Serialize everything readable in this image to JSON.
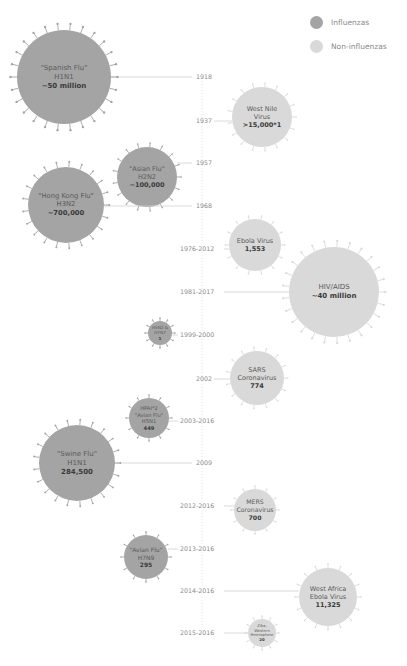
{
  "legend": [
    {
      "label": "Influenzas",
      "color": "#a4a4a4"
    },
    {
      "label": "Non-influenzas",
      "color": "#d9d9d9"
    }
  ],
  "colors": {
    "influenza": "#a4a4a4",
    "non_influenza": "#d9d9d9",
    "axis": "#e2e2e2",
    "connector": "#d0d0d0",
    "text": "#8a8a8a"
  },
  "axis": {
    "x": 202,
    "top": 78,
    "bottom": 636
  },
  "events": [
    {
      "year": "1918",
      "type": "influenza",
      "lines": [
        "\"Spanish Flu\"",
        "H1N1"
      ],
      "value": "~50 million",
      "cx": 64,
      "cy": 77,
      "r": 47,
      "year_y": 77,
      "fs": 7
    },
    {
      "year": "1937",
      "type": "non_influenza",
      "lines": [
        "West Nile",
        "Virus"
      ],
      "value": ">15,000*1",
      "cx": 262,
      "cy": 117,
      "r": 30,
      "year_y": 121,
      "fs": 6.5
    },
    {
      "year": "1957",
      "type": "influenza",
      "lines": [
        "\"Asian Flu\"",
        "H2N2"
      ],
      "value": "~100,000",
      "cx": 147,
      "cy": 177,
      "r": 30,
      "year_y": 163,
      "fs": 6.5
    },
    {
      "year": "1968",
      "type": "influenza",
      "lines": [
        "\"Hong Kong Flu\"",
        "H3N2"
      ],
      "value": "~700,000",
      "cx": 66,
      "cy": 205,
      "r": 38,
      "year_y": 206,
      "fs": 6.8
    },
    {
      "year": "1976-2012",
      "type": "non_influenza",
      "lines": [
        "Ebola Virus"
      ],
      "value": "1,553",
      "cx": 255,
      "cy": 245,
      "r": 26,
      "year_y": 249,
      "fs": 6.5
    },
    {
      "year": "1981-2017",
      "type": "non_influenza",
      "lines": [
        "HIV/AIDS"
      ],
      "value": "~40 million",
      "cx": 334,
      "cy": 292,
      "r": 45,
      "year_y": 292,
      "fs": 7
    },
    {
      "year": "1999-2000",
      "type": "influenza",
      "lines": [
        "H5N2 &",
        "H7N7"
      ],
      "value": "1",
      "cx": 160,
      "cy": 333,
      "r": 12,
      "year_y": 335,
      "fs": 4.2
    },
    {
      "year": "2002",
      "type": "non_influenza",
      "lines": [
        "SARS",
        "Coronavirus"
      ],
      "value": "774",
      "cx": 257,
      "cy": 378,
      "r": 27,
      "year_y": 379,
      "fs": 6.5
    },
    {
      "year": "2003-2016",
      "type": "influenza",
      "lines": [
        "HPAI*2",
        "\"Avian Flu\"",
        "H5N1"
      ],
      "value": "449",
      "cx": 149,
      "cy": 418,
      "r": 20,
      "year_y": 421,
      "fs": 5.2
    },
    {
      "year": "2009",
      "type": "influenza",
      "lines": [
        "\"Swine Flu\"",
        "H1N1"
      ],
      "value": "284,500",
      "cx": 77,
      "cy": 463,
      "r": 38,
      "year_y": 463,
      "fs": 7
    },
    {
      "year": "2012-2016",
      "type": "non_influenza",
      "lines": [
        "MERS",
        "Coronavirus"
      ],
      "value": "700",
      "cx": 255,
      "cy": 510,
      "r": 21,
      "year_y": 506,
      "fs": 6.2
    },
    {
      "year": "2013-2016",
      "type": "influenza",
      "lines": [
        "\"Avian Flu\"",
        "H7N9"
      ],
      "value": "295",
      "cx": 146,
      "cy": 557,
      "r": 22,
      "year_y": 549,
      "fs": 6
    },
    {
      "year": "2014-2016",
      "type": "non_influenza",
      "lines": [
        "West Africa",
        "Ebola Virus"
      ],
      "value": "11,325",
      "cx": 328,
      "cy": 597,
      "r": 29,
      "year_y": 591,
      "fs": 6.5
    },
    {
      "year": "2015-2016",
      "type": "non_influenza",
      "lines": [
        "Zika,",
        "Western",
        "Hemisphere"
      ],
      "value": "20",
      "cx": 262,
      "cy": 633,
      "r": 14,
      "year_y": 633,
      "fs": 3.8
    }
  ],
  "chart_data": {
    "type": "scatter",
    "title": "",
    "xlabel": "",
    "ylabel": "Year of outbreak",
    "legend": [
      "Influenzas",
      "Non-influenzas"
    ],
    "legend_position": "top-right",
    "grid": false,
    "encoding": "bubble size = estimated deaths; vertical position = year; color = influenza vs non-influenza",
    "series": [
      {
        "name": "Influenzas",
        "points": [
          {
            "year": "1918",
            "label": "\"Spanish Flu\" H1N1",
            "deaths": "~50 million"
          },
          {
            "year": "1957",
            "label": "\"Asian Flu\" H2N2",
            "deaths": "~100,000"
          },
          {
            "year": "1968",
            "label": "\"Hong Kong Flu\" H3N2",
            "deaths": "~700,000"
          },
          {
            "year": "1999-2000",
            "label": "H5N2 & H7N7",
            "deaths": "1"
          },
          {
            "year": "2003-2016",
            "label": "HPAI*2 \"Avian Flu\" H5N1",
            "deaths": "449"
          },
          {
            "year": "2009",
            "label": "\"Swine Flu\" H1N1",
            "deaths": "284,500"
          },
          {
            "year": "2013-2016",
            "label": "\"Avian Flu\" H7N9",
            "deaths": "295"
          }
        ]
      },
      {
        "name": "Non-influenzas",
        "points": [
          {
            "year": "1937",
            "label": "West Nile Virus",
            "deaths": ">15,000*1"
          },
          {
            "year": "1976-2012",
            "label": "Ebola Virus",
            "deaths": "1,553"
          },
          {
            "year": "1981-2017",
            "label": "HIV/AIDS",
            "deaths": "~40 million"
          },
          {
            "year": "2002",
            "label": "SARS Coronavirus",
            "deaths": "774"
          },
          {
            "year": "2012-2016",
            "label": "MERS Coronavirus",
            "deaths": "700"
          },
          {
            "year": "2014-2016",
            "label": "West Africa Ebola Virus",
            "deaths": "11,325"
          },
          {
            "year": "2015-2016",
            "label": "Zika, Western Hemisphere",
            "deaths": "20"
          }
        ]
      }
    ]
  }
}
